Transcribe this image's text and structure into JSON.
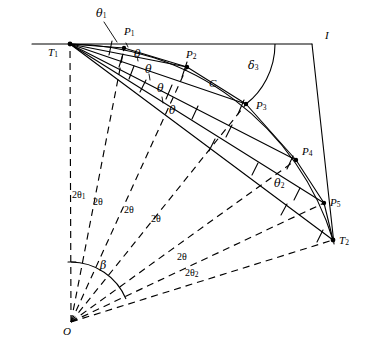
{
  "figure": {
    "type": "geometry-diagram",
    "title": ""
  },
  "points": {
    "T1": {
      "label": "T",
      "sub": "1",
      "x": 70,
      "y": 44
    },
    "T2": {
      "label": "T",
      "sub": "2",
      "x": 333,
      "y": 240
    },
    "O": {
      "label": "O",
      "sub": "",
      "x": 71,
      "y": 322
    },
    "I": {
      "label": "I",
      "sub": "",
      "x": 312,
      "y": 44
    },
    "P1": {
      "label": "P",
      "sub": "1",
      "x": 124,
      "y": 48
    },
    "P2": {
      "label": "P",
      "sub": "2",
      "x": 187,
      "y": 67
    },
    "P3": {
      "label": "P",
      "sub": "3",
      "x": 246,
      "y": 104
    },
    "P4": {
      "label": "P",
      "sub": "4",
      "x": 296,
      "y": 160
    },
    "P5": {
      "label": "P",
      "sub": "5",
      "x": 324,
      "y": 203
    }
  },
  "labels": {
    "theta1": {
      "text": "θ",
      "sub": "1",
      "x": 98,
      "y": 10
    },
    "theta_a": {
      "text": "θ",
      "sub": "",
      "x": 135,
      "y": 50
    },
    "theta_b": {
      "text": "θ",
      "sub": "",
      "x": 146,
      "y": 67
    },
    "theta_c": {
      "text": "θ",
      "sub": "",
      "x": 158,
      "y": 86
    },
    "theta_d": {
      "text": "θ",
      "sub": "",
      "x": 170,
      "y": 108
    },
    "theta2": {
      "text": "θ",
      "sub": "2",
      "x": 276,
      "y": 180
    },
    "delta3": {
      "text": "δ",
      "sub": "3",
      "x": 249,
      "y": 62
    },
    "C": {
      "text": "C",
      "sub": "",
      "x": 210,
      "y": 79
    },
    "two_theta1": {
      "text": "2θ",
      "sub": "1",
      "x": 71,
      "y": 192
    },
    "two_theta_a": {
      "text": "2θ",
      "sub": "",
      "x": 94,
      "y": 198
    },
    "two_theta_b": {
      "text": "2θ",
      "sub": "",
      "x": 125,
      "y": 206
    },
    "two_theta_c": {
      "text": "2θ",
      "sub": "",
      "x": 152,
      "y": 215
    },
    "two_theta_d": {
      "text": "2θ",
      "sub": "",
      "x": 178,
      "y": 253
    },
    "two_theta2": {
      "text": "2θ",
      "sub": "2",
      "x": 186,
      "y": 269
    },
    "beta": {
      "text": "β",
      "sub": "",
      "x": 101,
      "y": 262
    }
  },
  "colors": {
    "stroke": "#000000",
    "background": "#ffffff"
  }
}
